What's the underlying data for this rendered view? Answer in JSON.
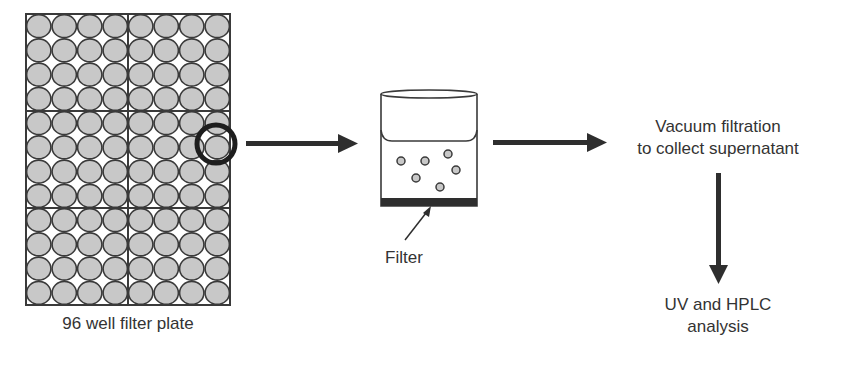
{
  "diagram": {
    "plate": {
      "label": "96 well filter plate",
      "columns": 8,
      "rows": 12,
      "well_fill": "#c8c8c8",
      "stroke": "#3a3a3a"
    },
    "beaker": {
      "filter_label": "Filter",
      "particle_count": 6,
      "filter_color": "#2e2e2e"
    },
    "steps": {
      "vacuum_line1": "Vacuum filtration",
      "vacuum_line2": "to collect supernatant",
      "analysis_line1": "UV and HPLC",
      "analysis_line2": "analysis"
    },
    "colors": {
      "arrow": "#2e2e2e",
      "text": "#333333",
      "background": "#ffffff"
    }
  }
}
